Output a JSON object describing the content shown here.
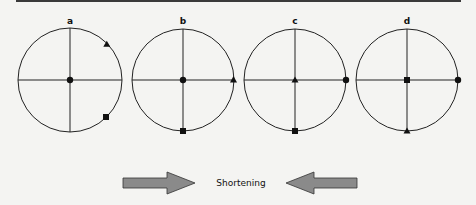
{
  "figure": {
    "panels": [
      {
        "label": "a",
        "center": [
          70,
          80
        ],
        "radius": 52,
        "markers": [
          {
            "shape": "circle",
            "position": "center"
          },
          {
            "shape": "triangle",
            "angle_deg": 45
          },
          {
            "shape": "square",
            "angle_deg": -45
          }
        ]
      },
      {
        "label": "b",
        "center": [
          183,
          80
        ],
        "radius": 51,
        "markers": [
          {
            "shape": "circle",
            "position": "center"
          },
          {
            "shape": "triangle",
            "angle_deg": 0
          },
          {
            "shape": "square",
            "angle_deg": -90
          }
        ]
      },
      {
        "label": "c",
        "center": [
          295,
          80
        ],
        "radius": 51,
        "markers": [
          {
            "shape": "triangle",
            "position": "center"
          },
          {
            "shape": "circle",
            "angle_deg": 0
          },
          {
            "shape": "square",
            "angle_deg": -90
          }
        ]
      },
      {
        "label": "d",
        "center": [
          407,
          80
        ],
        "radius": 51,
        "markers": [
          {
            "shape": "square",
            "position": "center"
          },
          {
            "shape": "circle",
            "angle_deg": 0
          },
          {
            "shape": "triangle",
            "angle_deg": -90
          }
        ]
      }
    ],
    "caption": "Shortening",
    "arrows": [
      {
        "direction": "right",
        "name": "right-arrow"
      },
      {
        "direction": "left",
        "name": "left-arrow"
      }
    ],
    "colors": {
      "line": "#222222",
      "arrow_fill": "#8a8a8a",
      "arrow_stroke": "#333333",
      "background": "#f4f4f2"
    }
  }
}
